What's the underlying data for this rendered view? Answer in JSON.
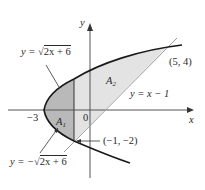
{
  "figure": {
    "axes": {
      "x_label": "x",
      "y_label": "y",
      "origin_label": "0",
      "tick_label_neg3": "−3"
    },
    "curves": {
      "upper": "y = √2x + 6",
      "upper_prefix": "y = ",
      "upper_radicand": "2x + 6",
      "lower_prefix": "y = −",
      "lower_radicand": "2x + 6",
      "line": "y = x − 1"
    },
    "regions": {
      "a1_main": "A",
      "a1_sub": "1",
      "a2_main": "A",
      "a2_sub": "2"
    },
    "points": {
      "top_right": "(5, 4)",
      "bottom_left": "(−1, −2)"
    },
    "colors": {
      "region_a1": "#b9b9b9",
      "region_a2": "#e3e3e3",
      "curve": "#1a1a1a",
      "line": "#9a9a9a",
      "axis": "#555555"
    }
  }
}
